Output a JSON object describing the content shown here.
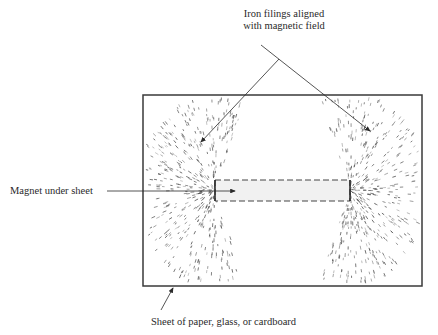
{
  "diagram": {
    "labels": {
      "filings_line1": "Iron filings aligned",
      "filings_line2": "with magnetic field",
      "magnet": "Magnet under sheet",
      "sheet": "Sheet of paper, glass, or cardboard"
    },
    "elements": {
      "sheet": {
        "shape": "rectangle",
        "x": 143,
        "y": 95,
        "width": 279,
        "height": 191
      },
      "magnet": {
        "shape": "dashed-rectangle",
        "x": 215,
        "y": 180,
        "width": 135,
        "height": 21
      },
      "filings": {
        "clusters": [
          "left-pole",
          "right-pole"
        ]
      }
    },
    "colors": {
      "ink": "#2a2a2a",
      "filings": "#555555",
      "sheet_border": "#3a3a3a"
    }
  }
}
